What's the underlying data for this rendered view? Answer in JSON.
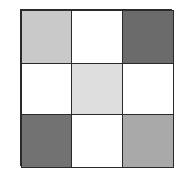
{
  "grid": {
    "rows": 3,
    "cols": 3,
    "cells": [
      {
        "row": 0,
        "col": 0,
        "shade": "light-gray",
        "color": "#c9c9c9"
      },
      {
        "row": 0,
        "col": 1,
        "shade": "white",
        "color": "#ffffff"
      },
      {
        "row": 0,
        "col": 2,
        "shade": "dark-gray",
        "color": "#6b6b6b"
      },
      {
        "row": 1,
        "col": 0,
        "shade": "white",
        "color": "#ffffff"
      },
      {
        "row": 1,
        "col": 1,
        "shade": "very-light-gray",
        "color": "#dedede"
      },
      {
        "row": 1,
        "col": 2,
        "shade": "white",
        "color": "#ffffff"
      },
      {
        "row": 2,
        "col": 0,
        "shade": "dark-gray",
        "color": "#727272"
      },
      {
        "row": 2,
        "col": 1,
        "shade": "white",
        "color": "#ffffff"
      },
      {
        "row": 2,
        "col": 2,
        "shade": "medium-gray",
        "color": "#a9a9a9"
      }
    ],
    "border_color": "#2a2a2a"
  }
}
